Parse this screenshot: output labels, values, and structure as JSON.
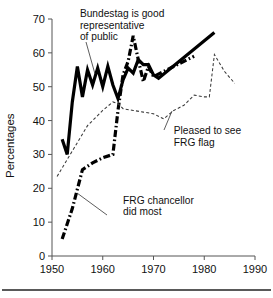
{
  "chart_data": {
    "type": "line",
    "title": "",
    "xlabel": "",
    "ylabel": "Percentages",
    "xlim": [
      1950,
      1990
    ],
    "ylim": [
      0,
      70
    ],
    "grid": false,
    "legend_position": "inline-annotations",
    "xticks": [
      1950,
      1960,
      1970,
      1980,
      1990
    ],
    "yticks": [
      0,
      10,
      20,
      30,
      40,
      50,
      60,
      70
    ],
    "xtick_labels": [
      "1950",
      "1960",
      "1970",
      "1980",
      "1990"
    ],
    "ytick_labels": [
      "0",
      "10",
      "20",
      "30",
      "40",
      "50",
      "60",
      "70"
    ],
    "annotations": [
      {
        "id": "bundestag",
        "text_lines": [
          "Bundestag is good",
          "representative",
          "of public"
        ],
        "x": 1955.5,
        "y": 70.5
      },
      {
        "id": "frg-flag",
        "text_lines": [
          "Pleased to see",
          "FRG flag"
        ],
        "x": 1974.0,
        "y": 36.0
      },
      {
        "id": "frg-chancellor",
        "text_lines": [
          "FRG chancellor",
          "did most"
        ],
        "x": 1964.0,
        "y": 15.5
      }
    ],
    "series": [
      {
        "name": "Bundestag is good representative of public",
        "style": "solid-thick",
        "color": "#000000",
        "x": [
          1952,
          1953,
          1954,
          1955,
          1956,
          1957,
          1958,
          1959,
          1960,
          1961,
          1962,
          1963,
          1964,
          1965,
          1966,
          1967,
          1968,
          1969,
          1970,
          1971,
          1982
        ],
        "values": [
          34.5,
          30.0,
          45.5,
          56.0,
          47.0,
          55.0,
          50.5,
          55.5,
          50.0,
          56.0,
          50.5,
          46.5,
          52.0,
          55.5,
          54.0,
          58.0,
          56.5,
          56.5,
          53.5,
          52.5,
          66.0
        ]
      },
      {
        "name": "FRG chancellor did most",
        "style": "dash-dot-thick",
        "color": "#000000",
        "x": [
          1952,
          1954,
          1956,
          1958,
          1960,
          1962,
          1963,
          1964,
          1965,
          1966,
          1967,
          1968,
          1969,
          1970,
          1978
        ],
        "values": [
          5.0,
          14.0,
          25.5,
          27.5,
          29.0,
          30.0,
          43.0,
          53.5,
          57.5,
          65.0,
          58.0,
          51.5,
          56.0,
          53.0,
          59.0
        ]
      },
      {
        "name": "Pleased to see FRG flag",
        "style": "dashed-thin",
        "color": "#3a3a3a",
        "x": [
          1951,
          1954,
          1957,
          1960,
          1962,
          1963,
          1964,
          1966,
          1968,
          1970,
          1972,
          1974,
          1976,
          1978,
          1980,
          1981,
          1982,
          1984,
          1986
        ],
        "values": [
          23.5,
          31.0,
          38.5,
          43.0,
          45.5,
          45.0,
          43.5,
          43.0,
          42.5,
          42.0,
          40.5,
          43.0,
          44.5,
          47.5,
          47.0,
          47.0,
          59.5,
          54.5,
          51.0
        ]
      }
    ]
  }
}
